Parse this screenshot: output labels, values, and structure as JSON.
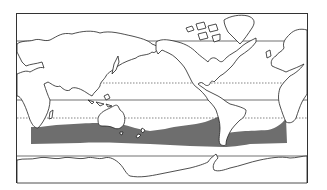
{
  "map": {
    "type": "world-outline",
    "projection": "equirectangular",
    "frame": {
      "x": 16,
      "y": 13,
      "width": 292,
      "height": 170
    },
    "colors": {
      "land_outline": "#222222",
      "ocean": "#ffffff",
      "shaded_region": "#6e6e6e",
      "grid_line": "#333333"
    },
    "latitude_lines": [
      {
        "name": "arctic-circle",
        "y": 41,
        "style": "solid"
      },
      {
        "name": "tropic-of-cancer",
        "y": 83,
        "style": "dashed"
      },
      {
        "name": "equator",
        "y": 100,
        "style": "solid"
      },
      {
        "name": "tropic-of-capricorn",
        "y": 118,
        "style": "dashed"
      },
      {
        "name": "antarctic-circle",
        "y": 156,
        "style": "solid"
      }
    ],
    "shaded_band": {
      "name": "southern-ocean-belt",
      "description": "Shaded zone in southern mid-latitude oceans between roughly 30°S and 50°S"
    }
  }
}
